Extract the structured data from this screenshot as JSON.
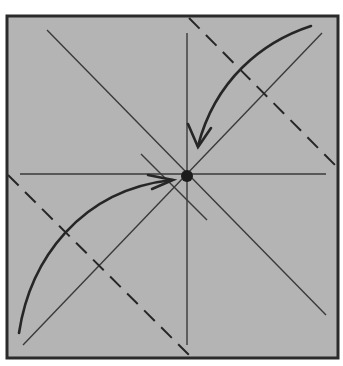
{
  "diagram": {
    "title": "Origami fold step: fold two opposite corners to the center point",
    "colors": {
      "paper": "#b4b4b4",
      "border": "#2a2a2a",
      "line": "#3a3a3a",
      "arrow": "#262626",
      "dot": "#1c1c1c",
      "background": "#ffffff"
    },
    "square": {
      "x": 7,
      "y": 16,
      "width": 331,
      "height": 342
    },
    "crease_lines": [
      {
        "name": "horizontal-center-crease",
        "x1": 20,
        "y1": 174,
        "x2": 326,
        "y2": 174
      },
      {
        "name": "vertical-center-crease",
        "x1": 187,
        "y1": 33,
        "x2": 187,
        "y2": 345
      },
      {
        "name": "diagonal-crease-tl-br",
        "x1": 47,
        "y1": 30,
        "x2": 326,
        "y2": 315
      },
      {
        "name": "diagonal-crease-bl-tr",
        "x1": 23,
        "y1": 345,
        "x2": 322,
        "y2": 33
      },
      {
        "name": "short-diagonal-crease",
        "x1": 141,
        "y1": 154,
        "x2": 207,
        "y2": 220
      }
    ],
    "fold_lines": [
      {
        "name": "dashed-valley-fold-top-right",
        "x1": 189,
        "y1": 18,
        "x2": 337,
        "y2": 167
      },
      {
        "name": "dashed-valley-fold-bottom-left",
        "x1": 8,
        "y1": 175,
        "x2": 190,
        "y2": 356
      }
    ],
    "reference_point": {
      "name": "center-dot",
      "cx": 187,
      "cy": 176,
      "r": 6
    },
    "arrows": [
      {
        "name": "fold-arrow-top-right",
        "path": "M 311 26 C 262 42 215 80 198 146",
        "head": "188,124 198,147 211,128"
      },
      {
        "name": "fold-arrow-bottom-left",
        "path": "M 19 333 C 30 260 80 190 172 180",
        "head": "148,175 173,180 152,189"
      }
    ]
  }
}
